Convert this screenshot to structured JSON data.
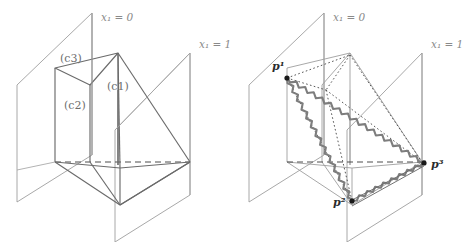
{
  "figure": {
    "width": 476,
    "height": 242,
    "background": "#ffffff",
    "colors": {
      "plane_line": "#9a9a9a",
      "solid_edge": "#6b6b6b",
      "dashed_edge": "#555555",
      "dotted_edge": "#4d4d4d",
      "zigzag_edge": "#7d7d7d",
      "point_marker": "#1a1a1a",
      "label_gray": "#8a8a8a",
      "label_dark": "#2b2b2b"
    }
  },
  "left_panel": {
    "name": "polyhedron-with-labeled-faces",
    "plane_labels": [
      {
        "id": "x1-eq-0",
        "variable": "x",
        "subscript": "1",
        "equals": "=",
        "value": "0",
        "full": "x₁ = 0"
      },
      {
        "id": "x1-eq-1",
        "variable": "x",
        "subscript": "1",
        "equals": "=",
        "value": "1",
        "full": "x₁ = 1"
      }
    ],
    "face_labels": [
      {
        "id": "c1",
        "text": "(c1)"
      },
      {
        "id": "c2",
        "text": "(c2)"
      },
      {
        "id": "c3",
        "text": "(c3)"
      }
    ]
  },
  "right_panel": {
    "name": "triangle-with-wavy-edges",
    "plane_labels": [
      {
        "id": "x1-eq-0",
        "variable": "x",
        "subscript": "1",
        "equals": "=",
        "value": "0",
        "full": "x₁ = 0"
      },
      {
        "id": "x1-eq-1",
        "variable": "x",
        "subscript": "1",
        "equals": "=",
        "value": "1",
        "full": "x₁ = 1"
      }
    ],
    "point_labels": [
      {
        "id": "p1",
        "base": "p",
        "superscript": "1",
        "full": "p¹"
      },
      {
        "id": "p2",
        "base": "p",
        "superscript": "2",
        "full": "p²"
      },
      {
        "id": "p3",
        "base": "p",
        "superscript": "3",
        "full": "p³"
      }
    ]
  }
}
